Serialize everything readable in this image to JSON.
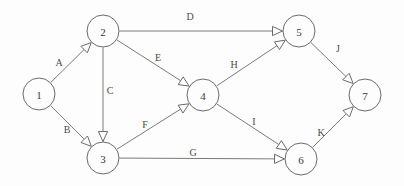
{
  "figure": {
    "type": "directed-graph-diagram",
    "background_color": "#fdfdfd",
    "line_color": "#7a7a7a",
    "node_radius": 16,
    "width": 404,
    "height": 186
  },
  "nodes": [
    {
      "id": "1",
      "label": "1",
      "x": 39,
      "y": 94
    },
    {
      "id": "2",
      "label": "2",
      "x": 103,
      "y": 31
    },
    {
      "id": "3",
      "label": "3",
      "x": 103,
      "y": 158
    },
    {
      "id": "4",
      "label": "4",
      "x": 203,
      "y": 95
    },
    {
      "id": "5",
      "label": "5",
      "x": 299,
      "y": 31
    },
    {
      "id": "6",
      "label": "6",
      "x": 301,
      "y": 159
    },
    {
      "id": "7",
      "label": "7",
      "x": 365,
      "y": 95
    }
  ],
  "edges": [
    {
      "id": "A",
      "label": "A",
      "from": "1",
      "to": "2",
      "label_x": 59,
      "label_y": 62
    },
    {
      "id": "B",
      "label": "B",
      "from": "1",
      "to": "3",
      "label_x": 67,
      "label_y": 129
    },
    {
      "id": "C",
      "label": "C",
      "from": "2",
      "to": "3",
      "label_x": 110,
      "label_y": 90
    },
    {
      "id": "D",
      "label": "D",
      "from": "2",
      "to": "5",
      "label_x": 190,
      "label_y": 16
    },
    {
      "id": "E",
      "label": "E",
      "from": "2",
      "to": "4",
      "label_x": 158,
      "label_y": 57
    },
    {
      "id": "F",
      "label": "F",
      "from": "3",
      "to": "4",
      "label_x": 145,
      "label_y": 124
    },
    {
      "id": "G",
      "label": "G",
      "from": "3",
      "to": "6",
      "label_x": 193,
      "label_y": 152
    },
    {
      "id": "H",
      "label": "H",
      "from": "4",
      "to": "5",
      "label_x": 234,
      "label_y": 64
    },
    {
      "id": "I",
      "label": "I",
      "from": "4",
      "to": "6",
      "label_x": 254,
      "label_y": 121
    },
    {
      "id": "J",
      "label": "J",
      "from": "5",
      "to": "7",
      "label_x": 338,
      "label_y": 48
    },
    {
      "id": "K",
      "label": "K",
      "from": "6",
      "to": "7",
      "label_x": 321,
      "label_y": 132
    }
  ]
}
